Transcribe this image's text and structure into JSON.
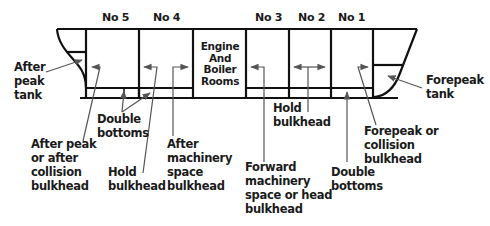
{
  "holds": [
    {
      "label": "No 5",
      "x": 107,
      "y": 12
    },
    {
      "label": "No 4",
      "x": 159,
      "y": 12
    },
    {
      "label": "No 3",
      "x": 262,
      "y": 12
    },
    {
      "label": "No 2",
      "x": 303,
      "y": 12
    },
    {
      "label": "No 1",
      "x": 344,
      "y": 12
    }
  ],
  "engine_room": {
    "label": "Engine\nAnd\nBoiler\nRooms"
  },
  "labels": {
    "after_peak_tank": "After\npeak\ntank",
    "forepeak_tank": "Forepeak\ntank",
    "double_bottoms_aft": "Double\nbottoms",
    "double_bottoms_fwd": "Double\nbottoms",
    "after_peak_bulkhead": "After peak\nor after\ncollision\nbulkhead",
    "hold_bulkhead_aft": "Hold\nbulkhead",
    "after_machinery_bulkhead": "After\nmachinery\nspace\nbulkhead",
    "forward_machinery_bulkhead": "Forward\nmachinery\nspace or head\nbulkhead",
    "hold_bulkhead_fwd": "Hold\nbulkhead",
    "forepeak_bulkhead": "Forepeak or\ncollision\nbulkhead"
  },
  "colors": {
    "outline": "#111111",
    "arrow": "#555555",
    "text": "#1a1a1a"
  }
}
